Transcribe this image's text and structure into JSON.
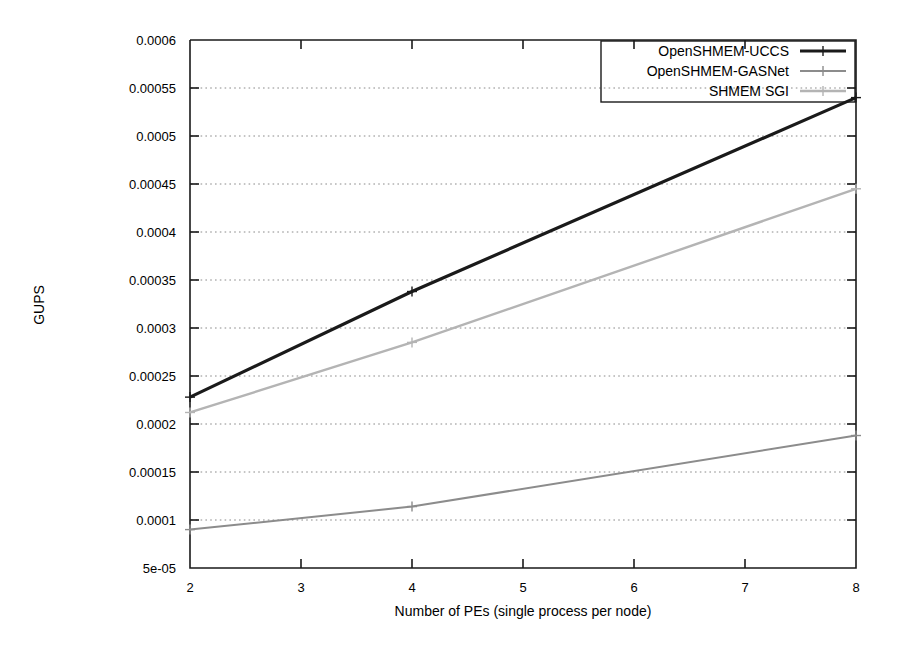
{
  "chart_data": {
    "type": "line",
    "title": "",
    "xlabel": "Number of PEs (single process per node)",
    "ylabel": "GUPS",
    "xlim": [
      2,
      8
    ],
    "ylim": [
      5e-05,
      0.0006
    ],
    "grid": true,
    "legend_position": "top-right",
    "x": [
      2,
      4,
      8
    ],
    "xticks": [
      2,
      3,
      4,
      5,
      6,
      7,
      8
    ],
    "xticklabels": [
      "2",
      "3",
      "4",
      "5",
      "6",
      "7",
      "8"
    ],
    "yticks": [
      5e-05,
      0.0001,
      0.00015,
      0.0002,
      0.00025,
      0.0003,
      0.00035,
      0.0004,
      0.00045,
      0.0005,
      0.00055,
      0.0006
    ],
    "yticklabels": [
      "5e-05",
      "0.0001",
      "0.00015",
      "0.0002",
      "0.00025",
      "0.0003",
      "0.00035",
      "0.0004",
      "0.00045",
      "0.0005",
      "0.00055",
      "0.0006"
    ],
    "series": [
      {
        "name": "OpenSHMEM-UCCS",
        "color": "#1a1a1a",
        "width": 3.2,
        "marker": "plus",
        "values": [
          0.000228,
          0.000338,
          0.00054
        ]
      },
      {
        "name": "OpenSHMEM-GASNet",
        "color": "#8c8c8c",
        "width": 2.0,
        "marker": "plus",
        "values": [
          9e-05,
          0.000114,
          0.000188
        ]
      },
      {
        "name": "SHMEM SGI",
        "color": "#b4b4b4",
        "width": 2.4,
        "marker": "plus",
        "values": [
          0.000212,
          0.000285,
          0.000445
        ]
      }
    ]
  },
  "legend": {
    "entries": [
      {
        "label": "OpenSHMEM-UCCS"
      },
      {
        "label": "OpenSHMEM-GASNet"
      },
      {
        "label": "SHMEM SGI"
      }
    ]
  },
  "axes": {
    "y_title": "GUPS",
    "x_title": "Number of PEs (single process per node)"
  }
}
